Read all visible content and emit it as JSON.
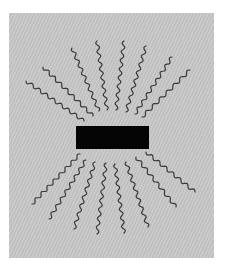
{
  "diagram": {
    "colors": {
      "page_background": "#ffffff",
      "panel_background": "#c6c6c6",
      "block": "#050505",
      "lines": "#3a3a3a"
    },
    "block": {
      "x": 76,
      "y": 126,
      "width": 73,
      "height": 23
    },
    "upper_lines": [
      {
        "outer": [
          26,
          81
        ],
        "inner": [
          84,
          121
        ]
      },
      {
        "outer": [
          43,
          67
        ],
        "inner": [
          93,
          116
        ]
      },
      {
        "outer": [
          72,
          48
        ],
        "inner": [
          99,
          111
        ]
      },
      {
        "outer": [
          97,
          41
        ],
        "inner": [
          107,
          110
        ]
      },
      {
        "outer": [
          124,
          41
        ],
        "inner": [
          116,
          110
        ]
      },
      {
        "outer": [
          146,
          46
        ],
        "inner": [
          126,
          112
        ]
      },
      {
        "outer": [
          172,
          57
        ],
        "inner": [
          135,
          114
        ]
      },
      {
        "outer": [
          190,
          70
        ],
        "inner": [
          142,
          117
        ]
      }
    ],
    "lower_lines": [
      {
        "inner": [
          80,
          154
        ],
        "outer": [
          32,
          204
        ]
      },
      {
        "inner": [
          86,
          160
        ],
        "outer": [
          49,
          219
        ]
      },
      {
        "inner": [
          95,
          162
        ],
        "outer": [
          74,
          229
        ]
      },
      {
        "inner": [
          106,
          163
        ],
        "outer": [
          97,
          234
        ]
      },
      {
        "inner": [
          115,
          164
        ],
        "outer": [
          124,
          233
        ]
      },
      {
        "inner": [
          126,
          162
        ],
        "outer": [
          148,
          227
        ]
      },
      {
        "inner": [
          136,
          157
        ],
        "outer": [
          176,
          207
        ]
      },
      {
        "inner": [
          146,
          152
        ],
        "outer": [
          195,
          192
        ]
      }
    ]
  }
}
